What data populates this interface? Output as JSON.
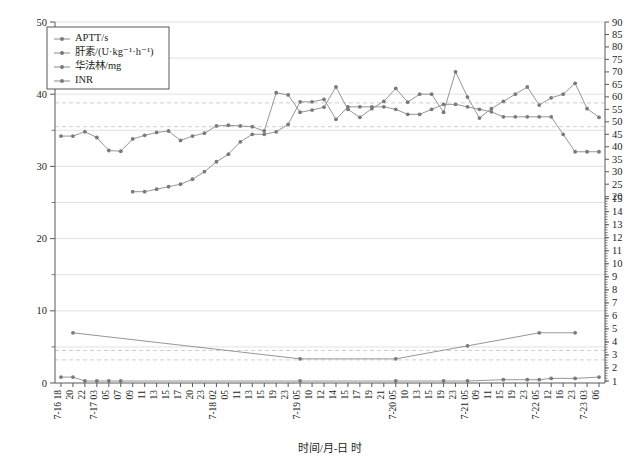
{
  "chart_data": {
    "type": "line",
    "title": "",
    "xlabel": "时间/月-日 时",
    "ylabel_left": "",
    "ylabel_right": "",
    "ylim_left": [
      0,
      50
    ],
    "left_ticks": [
      0,
      10,
      20,
      30,
      40,
      50
    ],
    "left_minor_step": 5,
    "right_upper_ticks": [
      20,
      25,
      30,
      35,
      40,
      45,
      50,
      55,
      60,
      65,
      70,
      75,
      80,
      85,
      90
    ],
    "right_lower_ticks": [
      1,
      2,
      3,
      4,
      5,
      6,
      7,
      8,
      9,
      10,
      11,
      12,
      13,
      14,
      15
    ],
    "grid": true,
    "legend_position": "top-left",
    "reference_lines_left": [
      38.8,
      35.5,
      4.5,
      3.2
    ],
    "categories": [
      "7-16 18",
      "20",
      "22",
      "7-17 03",
      "05",
      "07",
      "09",
      "11",
      "13",
      "15",
      "17",
      "20",
      "23",
      "7-18 02",
      "05",
      "11",
      "13",
      "15",
      "19",
      "23",
      "7-19 05",
      "10",
      "12",
      "14",
      "15",
      "17",
      "19",
      "21",
      "7-20 05",
      "10",
      "13",
      "15",
      "19",
      "23",
      "7-21 05",
      "09",
      "11",
      "15",
      "19",
      "23",
      "7-22 05",
      "12",
      "16",
      "23",
      "7-23 03",
      "06"
    ],
    "series": [
      {
        "name": "APTT/s",
        "axis": "left",
        "unit": "s",
        "values": [
          34.2,
          34.2,
          34.8,
          34.0,
          32.2,
          32.1,
          33.8,
          34.3,
          34.7,
          34.9,
          33.6,
          34.2,
          34.6,
          35.6,
          35.7,
          35.6,
          35.5,
          34.9,
          40.2,
          39.9,
          37.5,
          37.8,
          38.2,
          41.0,
          37.9,
          36.8,
          38.0,
          39.0,
          40.8,
          38.9,
          40.0,
          40.0,
          37.5,
          43.1,
          39.6,
          36.7,
          38.0,
          39.0,
          40.0,
          41.0,
          38.5,
          39.5,
          40.0,
          41.5,
          38.0,
          36.8
        ]
      },
      {
        "name": "肝素/(U·kg⁻¹·h⁻¹)",
        "axis": "right-upper",
        "unit": "U·kg⁻¹·h⁻¹",
        "values": [
          null,
          null,
          null,
          null,
          null,
          null,
          22,
          22,
          23,
          24,
          25,
          27,
          30,
          34,
          37,
          42,
          45,
          45,
          46,
          49,
          58,
          58,
          59,
          51,
          56,
          56,
          56,
          56,
          55,
          53,
          53,
          55,
          57,
          57,
          56,
          55,
          54,
          52,
          52,
          52,
          52,
          52,
          45,
          38,
          38,
          38
        ]
      },
      {
        "name": "华法林/mg",
        "axis": "right-lower",
        "unit": "mg",
        "values": [
          null,
          4.7,
          null,
          null,
          null,
          null,
          null,
          null,
          null,
          null,
          null,
          null,
          null,
          null,
          null,
          null,
          null,
          null,
          null,
          null,
          2.7,
          null,
          null,
          null,
          null,
          null,
          null,
          null,
          2.7,
          null,
          null,
          null,
          null,
          null,
          3.7,
          null,
          null,
          null,
          null,
          null,
          4.7,
          null,
          null,
          4.7,
          null,
          null
        ]
      },
      {
        "name": "INR",
        "axis": "right-lower",
        "values": [
          1.3,
          1.3,
          1.0,
          1.0,
          1.0,
          1.0,
          null,
          null,
          null,
          null,
          null,
          null,
          null,
          null,
          null,
          null,
          null,
          null,
          null,
          null,
          1.0,
          null,
          null,
          null,
          null,
          null,
          null,
          null,
          1.0,
          null,
          null,
          null,
          1.0,
          null,
          1.0,
          null,
          null,
          1.1,
          null,
          1.1,
          1.1,
          1.2,
          null,
          1.2,
          null,
          1.3
        ]
      }
    ],
    "legend_entries": [
      "APTT/s",
      "肝素/(U·kg⁻¹·h⁻¹)",
      "华法林/mg",
      "INR"
    ],
    "colors": {
      "series_line": "#8a8a8a",
      "series_marker": "#7a7a7a",
      "grid": "#d9dadb",
      "axis": "#58595b",
      "reference_line": "#c9c9c9",
      "background": "#ffffff"
    }
  }
}
